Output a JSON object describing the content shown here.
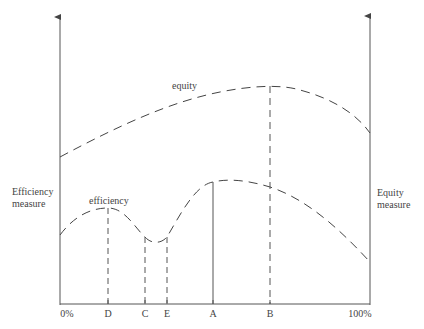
{
  "diagram": {
    "curves": {
      "equity": {
        "label": "equity"
      },
      "efficiency": {
        "label": "efficiency"
      }
    },
    "axes": {
      "left_label_line1": "Efficiency",
      "left_label_line2": "measure",
      "right_label_line1": "Equity",
      "right_label_line2": "measure"
    },
    "x_ticks": [
      "0%",
      "D",
      "C",
      "E",
      "A",
      "B",
      "100%"
    ],
    "colors": {
      "line": "#444444",
      "background": "#ffffff"
    }
  }
}
